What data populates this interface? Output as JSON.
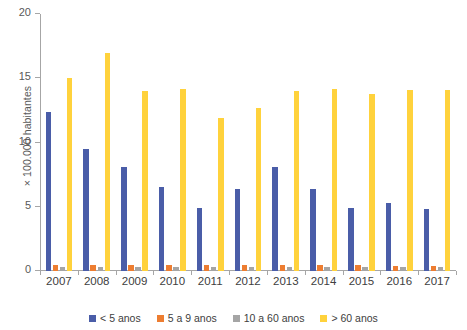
{
  "chart_data": {
    "type": "bar",
    "title": "",
    "xlabel": "",
    "ylabel": "× 100.000 habitantes",
    "ylim": [
      0,
      20
    ],
    "yticks": [
      0,
      5,
      10,
      15,
      20
    ],
    "grid": false,
    "legend_position": "bottom",
    "categories": [
      "2007",
      "2008",
      "2009",
      "2010",
      "2011",
      "2012",
      "2013",
      "2014",
      "2015",
      "2016",
      "2017"
    ],
    "series": [
      {
        "name": "< 5 anos",
        "color": "#4a5da8",
        "values": [
          12.4,
          9.5,
          8.1,
          6.5,
          4.9,
          6.4,
          8.1,
          6.4,
          4.9,
          5.3,
          4.8
        ]
      },
      {
        "name": "5 a 9 anos",
        "color": "#ed7d31",
        "values": [
          0.5,
          0.5,
          0.5,
          0.5,
          0.5,
          0.5,
          0.5,
          0.5,
          0.5,
          0.4,
          0.4
        ]
      },
      {
        "name": "10 a 60 anos",
        "color": "#a5a5a5",
        "values": [
          0.3,
          0.3,
          0.3,
          0.3,
          0.3,
          0.3,
          0.3,
          0.3,
          0.3,
          0.3,
          0.3
        ]
      },
      {
        "name": "> 60 anos",
        "color": "#ffd23c",
        "values": [
          15.0,
          17.0,
          14.0,
          14.2,
          11.9,
          12.7,
          14.0,
          14.2,
          13.8,
          14.1,
          14.1
        ]
      }
    ]
  }
}
